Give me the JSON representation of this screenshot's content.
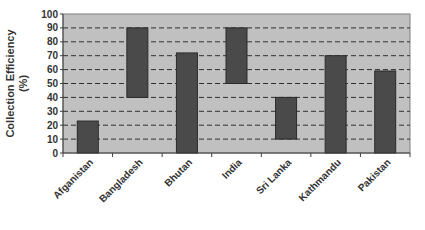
{
  "chart_data": {
    "type": "bar",
    "subtype": "floating-range",
    "title": "",
    "xlabel": "",
    "ylabel": "Collection Efficiency (%)",
    "ylabel_lines": [
      "Collection Efficiency",
      "(%)"
    ],
    "ylim": [
      0,
      100
    ],
    "yticks": [
      0,
      10,
      20,
      30,
      40,
      50,
      60,
      70,
      80,
      90,
      100
    ],
    "grid": "horizontal dashed",
    "legend": "none",
    "categories": [
      "Afganistan",
      "Bangladesh",
      "Bhutan",
      "India",
      "Sri Lanka",
      "Kathmandu",
      "Pakistan"
    ],
    "series": [
      {
        "name": "Min",
        "values": [
          0,
          40,
          0,
          50,
          10,
          0,
          0
        ]
      },
      {
        "name": "Max",
        "values": [
          23,
          90,
          72,
          90,
          40,
          70,
          59
        ]
      }
    ],
    "colors": {
      "bar": "#4a4a4a",
      "plot_bg": "#c0c0c0",
      "grid": "#333333"
    }
  }
}
